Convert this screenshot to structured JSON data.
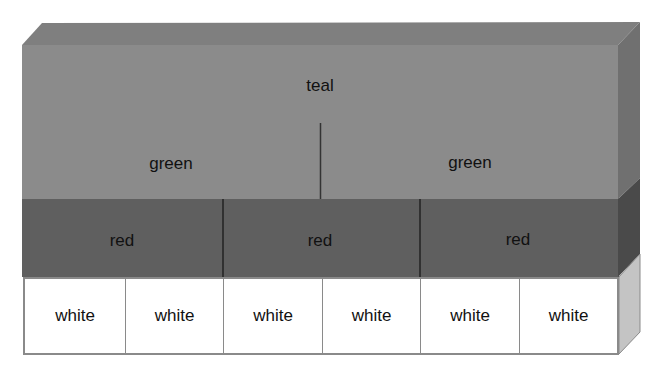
{
  "diagram": {
    "type": "3d-layered-block",
    "colors": {
      "top_face": "#7f7f7f",
      "teal_face": "#8b8b8b",
      "teal_side": "#6f6f6f",
      "red_face": "#5f5f5f",
      "red_side": "#4a4a4a",
      "white_face": "#ffffff",
      "white_side": "#bdbdbd",
      "divider": "#333333",
      "white_border": "#8a8a8a"
    },
    "layers": {
      "top": {
        "label": "teal",
        "children": [
          {
            "label": "green"
          },
          {
            "label": "green"
          }
        ]
      },
      "middle": {
        "cells": [
          {
            "label": "red"
          },
          {
            "label": "red"
          },
          {
            "label": "red"
          }
        ]
      },
      "bottom": {
        "cells": [
          {
            "label": "white"
          },
          {
            "label": "white"
          },
          {
            "label": "white"
          },
          {
            "label": "white"
          },
          {
            "label": "white"
          },
          {
            "label": "white"
          }
        ]
      }
    }
  }
}
